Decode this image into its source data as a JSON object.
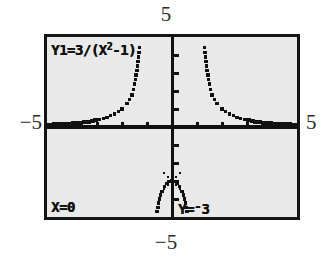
{
  "screen": {
    "device": "graphing-calculator-trace-screen",
    "equation_label": "Y1=3/(X²-1)",
    "equation_parts": {
      "prefix": "Y1=3/(X",
      "exponent": "2",
      "suffix": "-1)"
    },
    "trace": {
      "x_readout": "X=0",
      "y_readout_prefix": "Y=",
      "y_readout_sign": "-",
      "y_readout_value": "3",
      "y_readout": "Y=-3",
      "cursor_x": 0,
      "cursor_y": -3
    },
    "window_labels": {
      "ymax": "5",
      "ymin": "−5",
      "xmin": "−5",
      "xmax": "5"
    },
    "colors": {
      "lcd_background": "#e9e9e9",
      "frame": "#141414",
      "ink": "#111111",
      "page_background": "#ffffff",
      "label_ink": "#2b2b2b"
    }
  },
  "chart_data": {
    "type": "line",
    "xlabel": "",
    "ylabel": "",
    "xlim": [
      -5,
      5
    ],
    "ylim": [
      -5,
      5
    ],
    "xscl": 1,
    "yscl": 1,
    "grid": false,
    "legend": "none",
    "function": "y = 3/(x^2 - 1)",
    "asymptotes": {
      "vertical": [
        -1,
        1
      ],
      "horizontal": [
        0
      ]
    },
    "axes": {
      "x_ticks": [
        -4,
        -3,
        -2,
        -1,
        1,
        2,
        3,
        4
      ],
      "y_ticks": [
        -4,
        -3,
        -2,
        -1,
        1,
        2,
        3,
        4
      ]
    },
    "cursor_point": {
      "x": 0,
      "y": -3,
      "marker": "cross"
    },
    "series": [
      {
        "name": "left-outer-branch",
        "comment": "x < -1, approaches 0 from above as x -> -5",
        "x": [
          -5.0,
          -4.7,
          -4.4,
          -4.1,
          -3.8,
          -3.5,
          -3.2,
          -2.9,
          -2.6,
          -2.3,
          -2.0,
          -1.8,
          -1.6,
          -1.5,
          -1.4,
          -1.3,
          -1.25,
          -1.2,
          -1.15,
          -1.1
        ],
        "y": [
          0.125,
          0.142,
          0.164,
          0.191,
          0.227,
          0.273,
          0.334,
          0.418,
          0.539,
          0.722,
          1.0,
          1.293,
          1.786,
          2.4,
          3.125,
          4.412,
          5.33,
          6.82,
          9.3,
          14.3
        ]
      },
      {
        "name": "right-outer-branch",
        "comment": "x > 1, approaches 0 from above as x -> 5",
        "x": [
          1.1,
          1.15,
          1.2,
          1.25,
          1.3,
          1.4,
          1.5,
          1.6,
          1.8,
          2.0,
          2.3,
          2.6,
          2.9,
          3.2,
          3.5,
          3.8,
          4.1,
          4.4,
          4.7,
          5.0
        ],
        "y": [
          14.3,
          9.3,
          6.82,
          5.33,
          4.412,
          3.125,
          2.4,
          1.786,
          1.293,
          1.0,
          0.722,
          0.539,
          0.418,
          0.334,
          0.273,
          0.227,
          0.191,
          0.164,
          0.142,
          0.125
        ]
      },
      {
        "name": "middle-branch",
        "comment": "-1 < x < 1, maximum -3 at x = 0",
        "x": [
          -0.95,
          -0.9,
          -0.8,
          -0.7,
          -0.6,
          -0.5,
          -0.4,
          -0.3,
          -0.2,
          -0.1,
          0.0,
          0.1,
          0.2,
          0.3,
          0.4,
          0.5,
          0.6,
          0.7,
          0.8,
          0.9,
          0.95
        ],
        "y": [
          -30.8,
          -15.8,
          -8.33,
          -5.88,
          -4.69,
          -4.0,
          -3.57,
          -3.3,
          -3.13,
          -3.03,
          -3.0,
          -3.03,
          -3.13,
          -3.3,
          -3.57,
          -4.0,
          -4.69,
          -5.88,
          -8.33,
          -15.8,
          -30.8
        ]
      }
    ]
  }
}
